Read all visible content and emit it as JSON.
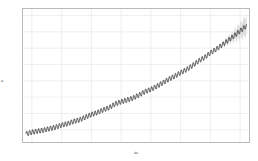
{
  "chart_data": {
    "type": "line",
    "title": "",
    "xlabel": "ds",
    "ylabel": "y",
    "xlim": [
      1957.0,
      2033.0
    ],
    "ylim": [
      305,
      468
    ],
    "grid": true,
    "legend": false,
    "xticks": [
      1960,
      1970,
      1980,
      1990,
      2000,
      2010,
      2020,
      2030
    ],
    "xticklabels": [
      "1960",
      "1970",
      "1980",
      "1990",
      "2000",
      "2010",
      "2020",
      "2030"
    ],
    "yticks": [
      320,
      340,
      360,
      380,
      400,
      420,
      440,
      460
    ],
    "yticklabels": [
      "320",
      "340",
      "360",
      "380",
      "400",
      "420",
      "440",
      "460"
    ],
    "history_end_x": 2023.0,
    "series": [
      {
        "name": "yhat",
        "color": "#1a1a1a",
        "x": [
          1958.0,
          1960.0,
          1962.0,
          1964.0,
          1966.0,
          1968.0,
          1970.0,
          1972.0,
          1974.0,
          1976.0,
          1978.0,
          1980.0,
          1982.0,
          1984.0,
          1986.0,
          1988.0,
          1990.0,
          1992.0,
          1994.0,
          1996.0,
          1998.0,
          2000.0,
          2002.0,
          2004.0,
          2006.0,
          2008.0,
          2010.0,
          2012.0,
          2014.0,
          2016.0,
          2018.0,
          2020.0,
          2022.0,
          2024.0,
          2026.0,
          2028.0,
          2030.0,
          2032.0
        ],
        "values": [
          315.0,
          316.9,
          318.4,
          319.6,
          321.4,
          323.1,
          325.7,
          327.4,
          330.2,
          332.1,
          335.4,
          338.7,
          341.1,
          344.4,
          347.2,
          351.6,
          354.4,
          356.4,
          358.8,
          362.6,
          366.7,
          369.5,
          373.3,
          377.5,
          381.9,
          385.6,
          389.9,
          393.8,
          398.6,
          404.2,
          408.5,
          414.2,
          418.8,
          424.1,
          429.6,
          435.2,
          441.0,
          447.0
        ],
        "seasonal_amplitude": 3.0,
        "seasonal_period_years": 1.0
      }
    ],
    "uncertainty": {
      "name": "yhat uncertainty interval",
      "color": "#d9d9d9",
      "opacity": 0.85,
      "start_x": 2023.0,
      "end_x": 2032.0,
      "half_width_at_start": 0.6,
      "half_width_at_end": 12.0
    }
  }
}
